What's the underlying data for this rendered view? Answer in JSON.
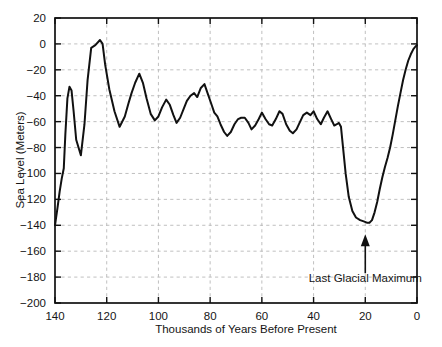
{
  "figure": {
    "background_color": "#ffffff",
    "line_color": "#111111",
    "grid_color": "#b9b9b9"
  },
  "chart_data": {
    "type": "line",
    "title": "",
    "xlabel": "Thousands of Years Before Present",
    "ylabel": "Sea Level (Meters)",
    "xlim": [
      140,
      0
    ],
    "ylim": [
      -200,
      20
    ],
    "x_ticks": [
      140,
      120,
      100,
      80,
      60,
      40,
      20,
      0
    ],
    "x_tick_labels": [
      "140",
      "120",
      "100",
      "80",
      "60",
      "40",
      "20",
      "0"
    ],
    "y_ticks": [
      20,
      0,
      -20,
      -40,
      -60,
      -80,
      -100,
      -120,
      -140,
      -160,
      -180,
      -200
    ],
    "y_tick_labels": [
      "20",
      "0",
      "-20",
      "-40",
      "-60",
      "-80",
      "-100",
      "-120",
      "-140",
      "-160",
      "-180",
      "-200"
    ],
    "x_axis_inverted": true,
    "grid": true,
    "grid_style": "dashed",
    "legend": "none",
    "series": [
      {
        "name": "Sea Level",
        "x": [
          140.0,
          139.0,
          138.2,
          137.4,
          136.6,
          136.0,
          135.2,
          134.4,
          133.6,
          132.8,
          131.8,
          130.0,
          128.6,
          127.4,
          126.0,
          124.4,
          122.6,
          121.6,
          120.6,
          119.0,
          117.0,
          115.0,
          113.0,
          111.6,
          110.4,
          109.0,
          107.4,
          106.0,
          104.6,
          103.0,
          101.4,
          100.0,
          98.6,
          97.0,
          95.6,
          94.2,
          93.0,
          91.6,
          90.2,
          89.0,
          87.6,
          86.2,
          85.0,
          83.6,
          82.2,
          81.0,
          79.6,
          78.4,
          77.2,
          76.0,
          74.6,
          73.4,
          72.0,
          70.6,
          69.2,
          68.0,
          66.6,
          65.2,
          64.0,
          62.6,
          61.2,
          60.0,
          58.6,
          57.2,
          56.0,
          54.6,
          53.2,
          52.0,
          50.6,
          49.2,
          48.0,
          46.6,
          45.2,
          44.0,
          42.6,
          41.2,
          40.0,
          38.6,
          37.2,
          36.0,
          34.6,
          33.2,
          32.0,
          31.0,
          30.2,
          29.4,
          28.6,
          27.6,
          26.4,
          25.0,
          23.6,
          22.0,
          20.6,
          19.4,
          18.4,
          17.4,
          16.4,
          15.4,
          14.4,
          13.4,
          12.4,
          11.4,
          10.4,
          9.4,
          8.4,
          7.4,
          6.4,
          5.4,
          4.4,
          3.4,
          2.4,
          1.4,
          0.6,
          0.0
        ],
        "y": [
          -140.0,
          -126.0,
          -114.0,
          -104.0,
          -96.0,
          -70.0,
          -42.0,
          -33.0,
          -36.0,
          -52.0,
          -74.0,
          -86.0,
          -62.0,
          -28.0,
          -3.0,
          -1.0,
          3.0,
          0.0,
          -16.0,
          -35.0,
          -52.0,
          -64.0,
          -56.0,
          -46.0,
          -38.0,
          -30.0,
          -23.0,
          -30.0,
          -42.0,
          -54.0,
          -59.0,
          -56.0,
          -49.0,
          -43.0,
          -47.0,
          -55.0,
          -61.0,
          -57.0,
          -50.0,
          -44.0,
          -40.0,
          -38.0,
          -41.0,
          -34.0,
          -31.0,
          -38.0,
          -46.0,
          -53.0,
          -56.0,
          -62.0,
          -68.0,
          -71.0,
          -68.0,
          -62.0,
          -58.0,
          -57.0,
          -57.0,
          -61.0,
          -66.0,
          -63.0,
          -58.0,
          -53.0,
          -58.0,
          -62.0,
          -63.0,
          -58.0,
          -52.0,
          -54.0,
          -62.0,
          -67.0,
          -69.0,
          -66.0,
          -60.0,
          -55.0,
          -53.0,
          -55.0,
          -52.0,
          -58.0,
          -62.0,
          -57.0,
          -52.0,
          -58.0,
          -63.0,
          -62.0,
          -61.0,
          -64.0,
          -80.0,
          -100.0,
          -118.0,
          -129.0,
          -134.0,
          -136.0,
          -137.0,
          -138.0,
          -138.0,
          -136.0,
          -130.0,
          -122.0,
          -112.0,
          -103.0,
          -95.0,
          -88.0,
          -80.0,
          -70.0,
          -59.0,
          -48.0,
          -38.0,
          -28.0,
          -20.0,
          -13.0,
          -8.0,
          -4.0,
          -2.0,
          -1.0
        ]
      }
    ],
    "annotations": [
      {
        "text": "Last Glacial Maximum",
        "x": 20,
        "y": -140,
        "label_x": 20,
        "label_y": -184,
        "arrow": true
      }
    ]
  }
}
